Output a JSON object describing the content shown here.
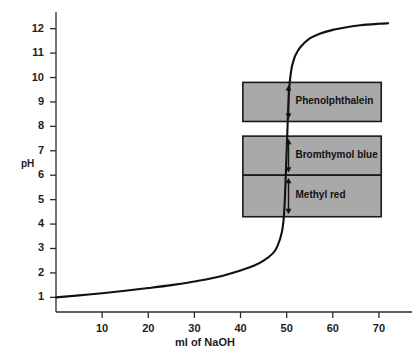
{
  "chart_data": {
    "type": "line",
    "title": "",
    "xlabel": "ml of NaOH",
    "ylabel": "pH",
    "xlim": [
      0,
      75
    ],
    "ylim": [
      0.4,
      12.6
    ],
    "grid": false,
    "legend": "none",
    "x_ticks": [
      10,
      20,
      30,
      40,
      50,
      60,
      70
    ],
    "x_tick_labels": [
      "10",
      "20",
      "30",
      "40",
      "50",
      "60",
      "70"
    ],
    "y_ticks": [
      1,
      2,
      3,
      4,
      5,
      6,
      7,
      8,
      9,
      10,
      11,
      12
    ],
    "y_tick_labels": [
      "1",
      "2",
      "3",
      "4",
      "5",
      "6",
      "7",
      "8",
      "9",
      "10",
      "11",
      "12"
    ],
    "series": [
      {
        "name": "titration curve",
        "x": [
          0,
          5,
          10,
          15,
          20,
          25,
          30,
          35,
          40,
          43,
          45,
          47,
          48,
          49,
          49.5,
          50,
          50.5,
          51,
          51.5,
          52,
          53,
          55,
          57,
          60,
          63,
          66,
          70,
          72
        ],
        "y": [
          1.0,
          1.08,
          1.17,
          1.27,
          1.38,
          1.5,
          1.65,
          1.83,
          2.1,
          2.3,
          2.5,
          2.8,
          3.1,
          3.7,
          4.6,
          7.0,
          9.4,
          10.3,
          10.7,
          10.95,
          11.25,
          11.6,
          11.78,
          11.95,
          12.06,
          12.14,
          12.2,
          12.22
        ]
      }
    ],
    "annotations": [
      {
        "name": "phenolphthalein-band",
        "label": "Phenolphthalein",
        "ph_low": 8.2,
        "ph_high": 9.8,
        "ml_start": 40.5,
        "ml_end": 70.5,
        "fill": "#a9a9a9"
      },
      {
        "name": "bromthymol-blue-band",
        "label": "Bromthymol blue",
        "ph_low": 6.0,
        "ph_high": 7.6,
        "ml_start": 40.5,
        "ml_end": 70.5,
        "fill": "#a9a9a9"
      },
      {
        "name": "methyl-red-band",
        "label": "Methyl red",
        "ph_low": 4.3,
        "ph_high": 6.0,
        "ml_start": 40.5,
        "ml_end": 70.5,
        "fill": "#a9a9a9"
      }
    ]
  },
  "axes": {
    "y_title": "pH",
    "x_title": "ml of NaOH"
  },
  "colors": {
    "curve": "#111111",
    "axis": "#2b2b2b",
    "band_fill": "#a9a9a9",
    "band_stroke": "#1a1a1a",
    "background": "#ffffff"
  }
}
